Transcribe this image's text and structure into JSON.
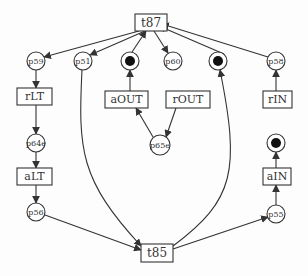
{
  "diagram": {
    "type": "petri-net",
    "colors": {
      "stroke": "#333333",
      "background": "#fdfdfd",
      "token": "#111111"
    },
    "transitions": [
      {
        "id": "t87",
        "label": "t87",
        "x": 135,
        "y": 14,
        "w": 32,
        "h": 17,
        "fs": 12
      },
      {
        "id": "rLT",
        "label": "rLT",
        "x": 17,
        "y": 88,
        "w": 35,
        "h": 17,
        "fs": 11
      },
      {
        "id": "aOUT",
        "label": "aOUT",
        "x": 105,
        "y": 91,
        "w": 43,
        "h": 17,
        "fs": 11
      },
      {
        "id": "rOUT",
        "label": "rOUT",
        "x": 166,
        "y": 91,
        "w": 44,
        "h": 17,
        "fs": 11
      },
      {
        "id": "rIN",
        "label": "rIN",
        "x": 263,
        "y": 91,
        "w": 29,
        "h": 17,
        "fs": 11
      },
      {
        "id": "aLT",
        "label": "aLT",
        "x": 17,
        "y": 168,
        "w": 35,
        "h": 17,
        "fs": 11
      },
      {
        "id": "aIN",
        "label": "aIN",
        "x": 263,
        "y": 168,
        "w": 28,
        "h": 17,
        "fs": 11
      },
      {
        "id": "t85",
        "label": "t85",
        "x": 141,
        "y": 244,
        "w": 32,
        "h": 18,
        "fs": 12
      }
    ],
    "places": [
      {
        "id": "p59",
        "label": "p59",
        "cx": 36,
        "cy": 61,
        "r": 9,
        "token": false
      },
      {
        "id": "p51",
        "label": "p51",
        "cx": 83,
        "cy": 61,
        "r": 9,
        "token": false
      },
      {
        "id": "pA",
        "label": "",
        "cx": 130,
        "cy": 61,
        "r": 9,
        "token": true
      },
      {
        "id": "p60",
        "label": "p60",
        "cx": 173,
        "cy": 61,
        "r": 9,
        "token": false
      },
      {
        "id": "pB",
        "label": "",
        "cx": 218,
        "cy": 61,
        "r": 9,
        "token": true
      },
      {
        "id": "p58",
        "label": "p58",
        "cx": 276,
        "cy": 61,
        "r": 9,
        "token": false
      },
      {
        "id": "p64e",
        "label": "p64e",
        "cx": 36,
        "cy": 143,
        "r": 9,
        "token": false
      },
      {
        "id": "p65e",
        "label": "p65e",
        "cx": 160,
        "cy": 145,
        "r": 10,
        "token": false
      },
      {
        "id": "pC",
        "label": "",
        "cx": 276,
        "cy": 143,
        "r": 9,
        "token": true
      },
      {
        "id": "p56",
        "label": "p56",
        "cx": 36,
        "cy": 212,
        "r": 9,
        "token": false
      },
      {
        "id": "p55",
        "label": "p55",
        "cx": 276,
        "cy": 214,
        "r": 9,
        "token": false
      }
    ],
    "arcs": [
      {
        "d": "M139,31 L44,57",
        "arrow": true
      },
      {
        "d": "M145,31 L90,55",
        "arrow": true
      },
      {
        "d": "M132,52 L146,31",
        "arrow": true
      },
      {
        "d": "M154,31 L168,53",
        "arrow": true
      },
      {
        "d": "M224,54 L159,26",
        "arrow": true
      },
      {
        "d": "M268,57 L162,24",
        "arrow": true
      },
      {
        "d": "M36,70 L36,88",
        "arrow": true
      },
      {
        "d": "M36,105 L36,134",
        "arrow": true
      },
      {
        "d": "M36,152 L36,168",
        "arrow": true
      },
      {
        "d": "M36,185 L36,203",
        "arrow": true
      },
      {
        "d": "M130,91 L130,70",
        "arrow": true
      },
      {
        "d": "M176,108 L166,137",
        "arrow": true
      },
      {
        "d": "M153,137 L136,108",
        "arrow": true
      },
      {
        "d": "M276,91 L276,70",
        "arrow": true
      },
      {
        "d": "M276,168 L276,152",
        "arrow": true
      },
      {
        "d": "M276,205 L276,185",
        "arrow": true
      },
      {
        "d": "M45,215 L141,250",
        "arrow": true
      },
      {
        "d": "M82,70 C78,150 80,180 141,246",
        "arrow": true
      },
      {
        "d": "M173,249 L268,217",
        "arrow": true
      },
      {
        "d": "M173,246 C235,200 240,170 220,70",
        "arrow": true
      }
    ]
  }
}
